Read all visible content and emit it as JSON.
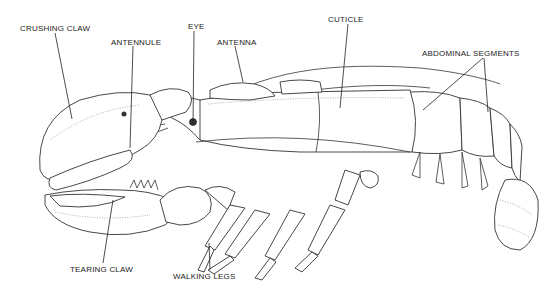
{
  "diagram": {
    "labels": [
      {
        "id": "crushing_claw",
        "text": "CRUSHING CLAW",
        "x": 20,
        "y": 24
      },
      {
        "id": "antennule",
        "text": "ANTENNULE",
        "x": 111,
        "y": 38
      },
      {
        "id": "eye",
        "text": "EYE",
        "x": 188,
        "y": 22
      },
      {
        "id": "antenna",
        "text": "ANTENNA",
        "x": 217,
        "y": 38
      },
      {
        "id": "cuticle",
        "text": "CUTICLE",
        "x": 328,
        "y": 15
      },
      {
        "id": "abdominal_segments",
        "text": "ABDOMINAL SEGMENTS",
        "x": 422,
        "y": 49
      },
      {
        "id": "tearing_claw",
        "text": "TEARING CLAW",
        "x": 70,
        "y": 265
      },
      {
        "id": "walking_legs",
        "text": "WALKING LEGS",
        "x": 173,
        "y": 272
      }
    ]
  }
}
